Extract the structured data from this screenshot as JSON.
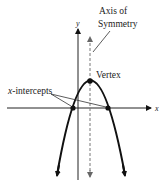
{
  "figure": {
    "labels": {
      "axis_of_symmetry_line1": "Axis of",
      "axis_of_symmetry_line2": "Symmetry",
      "vertex": "Vertex",
      "x_intercepts_var": "x",
      "x_intercepts_rest": "-intercepts",
      "y_axis": "y",
      "x_axis": "x"
    },
    "colors": {
      "ink": "#111111",
      "dashed": "#888888",
      "axis": "#222222"
    }
  }
}
